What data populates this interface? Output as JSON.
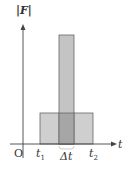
{
  "diagram": {
    "y_axis_label": "F",
    "x_axis_label": "t",
    "origin_label": "O",
    "ticks": [
      {
        "label": "t",
        "sub": "1"
      },
      {
        "label": "Δt",
        "sub": ""
      },
      {
        "label": "t",
        "sub": "2"
      }
    ],
    "shapes": [
      {
        "name": "long-low-pulse",
        "from": "t1",
        "to": "t2",
        "height": "low"
      },
      {
        "name": "short-tall-pulse",
        "width": "Δt",
        "height": "high"
      }
    ],
    "colors": {
      "fill": "#c8c8c8",
      "overlap": "#a8a8a8",
      "stroke": "#555555"
    }
  }
}
